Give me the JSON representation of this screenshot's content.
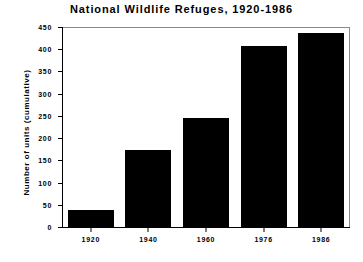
{
  "chart_data": {
    "type": "bar",
    "title": "National Wildlife Refuges, 1920-1986",
    "xlabel": "",
    "ylabel": "Number of units (cumulative)",
    "categories": [
      "1920",
      "1940",
      "1960",
      "1976",
      "1986"
    ],
    "values": [
      38,
      173,
      245,
      408,
      437
    ],
    "ylim": [
      0,
      450
    ],
    "yticks": [
      0,
      50,
      100,
      150,
      200,
      250,
      300,
      350,
      400,
      450
    ],
    "ytick_labels": [
      "0",
      "50",
      "100",
      "150",
      "200",
      "250",
      "300",
      "350",
      "400",
      "450"
    ],
    "grid": false,
    "legend": null,
    "bar_color": "#000000",
    "background_color": "#ffffff",
    "axis_color": "#000000",
    "frame_color": "#8a8a8a"
  }
}
